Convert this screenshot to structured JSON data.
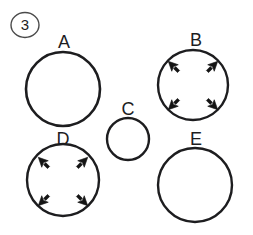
{
  "figure": {
    "number_marker": "3",
    "background_color": "#ffffff",
    "ink_color": "#1d1d1f",
    "width": 253,
    "height": 235
  },
  "circles": [
    {
      "label": "A",
      "cx": 63,
      "cy": 89,
      "r": 37,
      "stroke_width": 2.6,
      "label_x": 64,
      "label_y": 48,
      "has_arrows": false,
      "arrow_count": 0
    },
    {
      "label": "B",
      "cx": 193,
      "cy": 85,
      "r": 35,
      "stroke_width": 2.4,
      "label_x": 196,
      "label_y": 46,
      "has_arrows": true,
      "arrow_count": 4
    },
    {
      "label": "C",
      "cx": 128,
      "cy": 139,
      "r": 21,
      "stroke_width": 2.4,
      "label_x": 128,
      "label_y": 115,
      "has_arrows": false,
      "arrow_count": 0
    },
    {
      "label": "D",
      "cx": 63,
      "cy": 180,
      "r": 36,
      "stroke_width": 2.4,
      "label_x": 63,
      "label_y": 145,
      "has_arrows": true,
      "arrow_count": 4
    },
    {
      "label": "E",
      "cx": 195,
      "cy": 185,
      "r": 37,
      "stroke_width": 2.4,
      "label_x": 196,
      "label_y": 145,
      "has_arrows": false,
      "arrow_count": 0
    }
  ],
  "arrow_directions": [
    "north-west",
    "north-east",
    "south-west",
    "south-east"
  ],
  "arrow_note": "four arrows point radially outward toward the circle perimeter"
}
